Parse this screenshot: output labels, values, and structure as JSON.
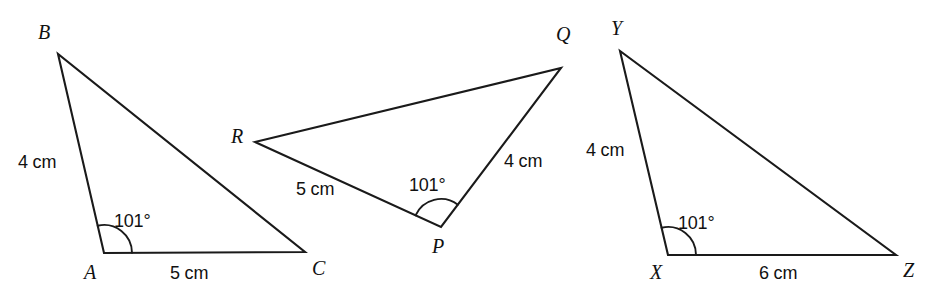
{
  "figure": {
    "width": 929,
    "height": 303,
    "background_color": "#ffffff",
    "stroke_color": "#1a1a1a",
    "text_color": "#111111"
  },
  "triangles": [
    {
      "name": "triangle-abc",
      "vertices": [
        {
          "label": "B",
          "x": 58,
          "y": 54,
          "label_x": 38,
          "label_y": 22
        },
        {
          "label": "A",
          "x": 104,
          "y": 253,
          "label_x": 84,
          "label_y": 262
        },
        {
          "label": "C",
          "x": 305,
          "y": 252,
          "label_x": 312,
          "label_y": 258
        }
      ],
      "sides": [
        {
          "name": "side-ab",
          "label": "4 cm",
          "label_x": 18,
          "label_y": 153
        },
        {
          "name": "side-ac",
          "label": "5 cm",
          "label_x": 170,
          "label_y": 264
        }
      ],
      "angle": {
        "name": "angle-a",
        "label": "101",
        "degree_symbol": "°",
        "label_x": 114,
        "label_y": 212,
        "vertex": "A"
      }
    },
    {
      "name": "triangle-pqr",
      "vertices": [
        {
          "label": "R",
          "x": 255,
          "y": 142,
          "label_x": 231,
          "label_y": 126
        },
        {
          "label": "Q",
          "x": 561,
          "y": 68,
          "label_x": 556,
          "label_y": 24
        },
        {
          "label": "P",
          "x": 441,
          "y": 227,
          "label_x": 432,
          "label_y": 236
        }
      ],
      "sides": [
        {
          "name": "side-rp",
          "label": "5 cm",
          "label_x": 296,
          "label_y": 180
        },
        {
          "name": "side-pq",
          "label": "4 cm",
          "label_x": 504,
          "label_y": 152
        }
      ],
      "angle": {
        "name": "angle-p",
        "label": "101",
        "degree_symbol": "°",
        "label_x": 409,
        "label_y": 176,
        "vertex": "P"
      }
    },
    {
      "name": "triangle-xyz",
      "vertices": [
        {
          "label": "Y",
          "x": 620,
          "y": 51,
          "label_x": 611,
          "label_y": 18
        },
        {
          "label": "X",
          "x": 668,
          "y": 255,
          "label_x": 650,
          "label_y": 262
        },
        {
          "label": "Z",
          "x": 896,
          "y": 255,
          "label_x": 903,
          "label_y": 260
        }
      ],
      "sides": [
        {
          "name": "side-xy",
          "label": "4 cm",
          "label_x": 586,
          "label_y": 141
        },
        {
          "name": "side-xz",
          "label": "6 cm",
          "label_x": 759,
          "label_y": 264
        }
      ],
      "angle": {
        "name": "angle-x",
        "label": "101",
        "degree_symbol": "°",
        "label_x": 678,
        "label_y": 214,
        "vertex": "X"
      }
    }
  ]
}
